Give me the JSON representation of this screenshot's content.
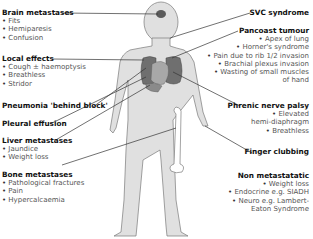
{
  "diagram": {
    "topic": "Clinical features of lung cancer",
    "colors": {
      "body_fill": "#e0e0e0",
      "body_stroke": "#7a7a7a",
      "lung_fill": "#6f6f6f",
      "heart_fill": "#a8a8a8",
      "leader_line": "#333333"
    },
    "left": [
      {
        "title": "Brain metastases",
        "items": [
          "Fits",
          "Hemiparesis",
          "Confusion"
        ]
      },
      {
        "title": "Local effects",
        "items": [
          "Cough ± haemoptysis",
          "Breathless",
          "Stridor"
        ]
      },
      {
        "title": "Pneumonia 'behind block'",
        "items": []
      },
      {
        "title": "Pleural effusion",
        "items": []
      },
      {
        "title": "Liver metastases",
        "items": [
          "Jaundice",
          "Weight loss"
        ]
      },
      {
        "title": "Bone metastases",
        "items": [
          "Pathological fractures",
          "Pain",
          "Hypercalcaemia"
        ]
      }
    ],
    "right": [
      {
        "title": "SVC syndrome",
        "items": []
      },
      {
        "title": "Pancoast tumour",
        "items": [
          "Apex of lung",
          "Horner's syndrome",
          "Pain due to rib 1/2 invasion",
          "Brachial plexus invasion",
          "Wasting of small muscles"
        ],
        "continuation": "of hand"
      },
      {
        "title": "Phrenic nerve palsy",
        "items": [
          "Elevated"
        ],
        "continuation": "hemi-diaphragm",
        "items2": [
          "Breathless"
        ]
      },
      {
        "title": "Finger clubbing",
        "items": []
      },
      {
        "title": "Non metastatatic",
        "items": [
          "Weight loss",
          "Endocrine e.g. SIADH",
          "Neuro e.g. Lambert-"
        ],
        "continuation": "Eaton Syndrome"
      }
    ]
  }
}
